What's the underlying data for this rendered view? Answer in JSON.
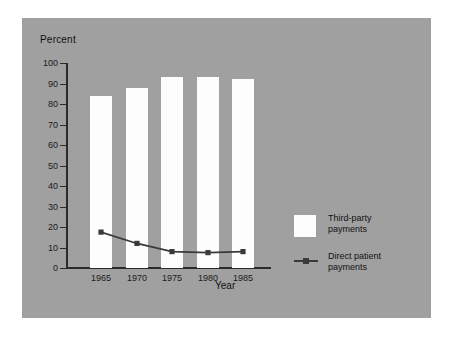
{
  "chart_data": {
    "type": "bar",
    "title": "",
    "subtitle": "",
    "xlabel": "Year",
    "ylabel": "Percent",
    "categories": [
      "1965",
      "1970",
      "1975",
      "1980",
      "1985"
    ],
    "x": [
      1965,
      1970,
      1975,
      1980,
      1985
    ],
    "ylim": [
      0,
      100
    ],
    "y_ticks": [
      0,
      10,
      20,
      30,
      40,
      50,
      60,
      70,
      80,
      90,
      100
    ],
    "y_tick_labels": [
      "0",
      "10",
      "20",
      "30",
      "40",
      "50",
      "60",
      "70",
      "80",
      "90",
      "100"
    ],
    "grid": false,
    "legend_position": "right",
    "series": [
      {
        "name": "Third-party payments",
        "type": "bar",
        "color": "#fdfdfd",
        "values": [
          84,
          88,
          93,
          93,
          92
        ]
      },
      {
        "name": "Direct patient payments",
        "type": "line",
        "color": "#3a3a3a",
        "marker": "square",
        "values": [
          17.5,
          12,
          8,
          7.5,
          8
        ]
      }
    ],
    "annotations": []
  },
  "legend": {
    "items": [
      {
        "label_line1": "Third-party",
        "label_line2": "payments",
        "marker": "white-square-swatch"
      },
      {
        "label_line1": "Direct patient",
        "label_line2": "payments",
        "marker": "line-with-square-marker"
      }
    ]
  },
  "colors": {
    "panel_background": "#a0a0a0",
    "page_background": "#ffffff",
    "bar_fill": "#fdfdfd",
    "line": "#3a3a3a",
    "axis": "#2b2b2b",
    "text": "#111111"
  }
}
